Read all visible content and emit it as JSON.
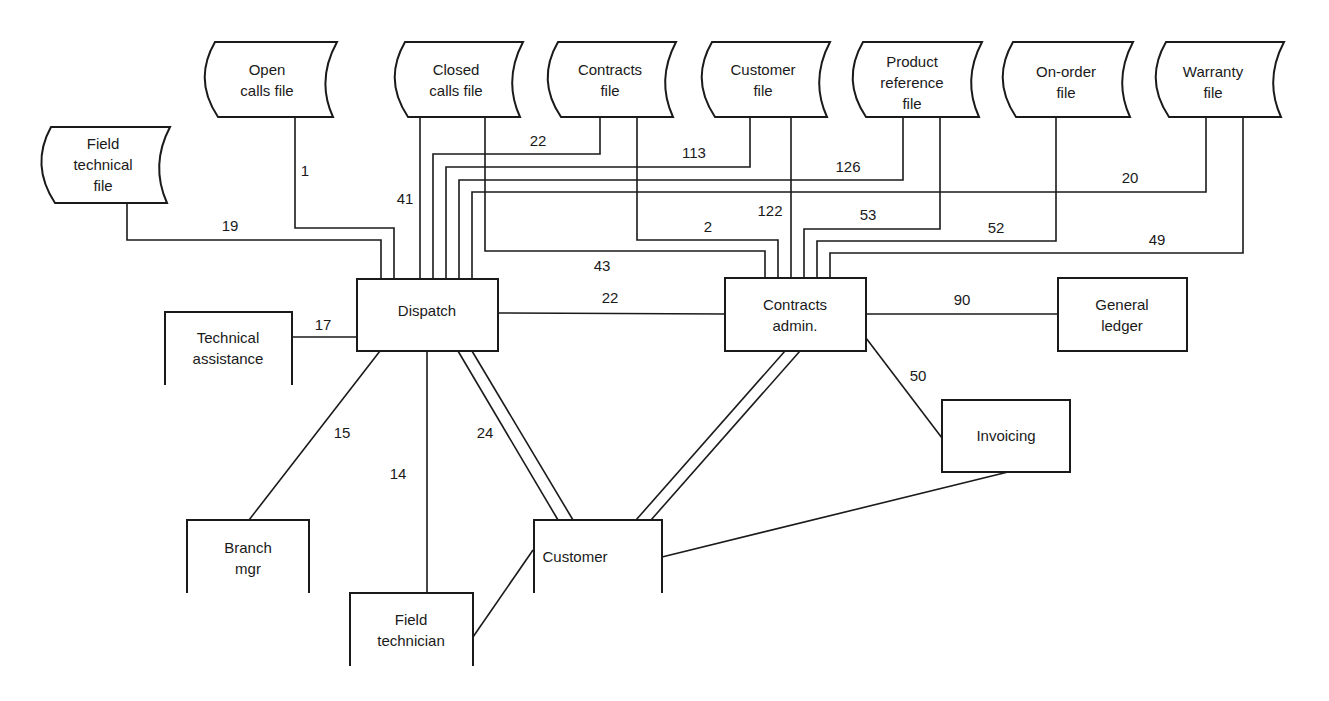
{
  "diagram": {
    "type": "data-flow-diagram",
    "files": [
      {
        "id": "field_technical_file",
        "label_lines": [
          "Field",
          "technical",
          "file"
        ]
      },
      {
        "id": "open_calls_file",
        "label_lines": [
          "Open",
          "calls file"
        ]
      },
      {
        "id": "closed_calls_file",
        "label_lines": [
          "Closed",
          "calls file"
        ]
      },
      {
        "id": "contracts_file",
        "label_lines": [
          "Contracts",
          "file"
        ]
      },
      {
        "id": "customer_file",
        "label_lines": [
          "Customer",
          "file"
        ]
      },
      {
        "id": "product_reference_file",
        "label_lines": [
          "Product",
          "reference",
          "file"
        ]
      },
      {
        "id": "on_order_file",
        "label_lines": [
          "On-order",
          "file"
        ]
      },
      {
        "id": "warranty_file",
        "label_lines": [
          "Warranty",
          "file"
        ]
      }
    ],
    "processes": [
      {
        "id": "dispatch",
        "label_lines": [
          "Dispatch"
        ]
      },
      {
        "id": "contracts_admin",
        "label_lines": [
          "Contracts",
          "admin."
        ]
      },
      {
        "id": "general_ledger",
        "label_lines": [
          "General",
          "ledger"
        ]
      },
      {
        "id": "invoicing",
        "label_lines": [
          "Invoicing"
        ]
      }
    ],
    "external_entities": [
      {
        "id": "technical_assistance",
        "label_lines": [
          "Technical",
          "assistance"
        ]
      },
      {
        "id": "branch_mgr",
        "label_lines": [
          "Branch",
          "mgr"
        ]
      },
      {
        "id": "field_technician",
        "label_lines": [
          "Field",
          "technician"
        ]
      },
      {
        "id": "customer",
        "label_lines": [
          "Customer"
        ]
      }
    ],
    "flows": [
      {
        "from": "field_technical_file",
        "to": "dispatch",
        "label": "19"
      },
      {
        "from": "open_calls_file",
        "to": "dispatch",
        "label": "1"
      },
      {
        "from": "closed_calls_file",
        "to": "dispatch",
        "label": "41"
      },
      {
        "from": "contracts_file",
        "to": "dispatch",
        "label": "22"
      },
      {
        "from": "customer_file",
        "to": "dispatch",
        "label": "113"
      },
      {
        "from": "product_reference_file",
        "to": "dispatch",
        "label": "126"
      },
      {
        "from": "warranty_file",
        "to": "dispatch",
        "label": "20"
      },
      {
        "from": "closed_calls_file",
        "to": "contracts_admin",
        "label": "43"
      },
      {
        "from": "contracts_file",
        "to": "contracts_admin",
        "label": "2"
      },
      {
        "from": "customer_file",
        "to": "contracts_admin",
        "label": "122"
      },
      {
        "from": "product_reference_file",
        "to": "contracts_admin",
        "label": "53"
      },
      {
        "from": "on_order_file",
        "to": "contracts_admin",
        "label": "52"
      },
      {
        "from": "warranty_file",
        "to": "contracts_admin",
        "label": "49"
      },
      {
        "from": "dispatch",
        "to": "contracts_admin",
        "label": "22"
      },
      {
        "from": "technical_assistance",
        "to": "dispatch",
        "label": "17"
      },
      {
        "from": "dispatch",
        "to": "branch_mgr",
        "label": "15"
      },
      {
        "from": "dispatch",
        "to": "field_technician",
        "label": "14"
      },
      {
        "from": "dispatch",
        "to": "customer",
        "label": "24"
      },
      {
        "from": "contracts_admin",
        "to": "general_ledger",
        "label": "90"
      },
      {
        "from": "contracts_admin",
        "to": "invoicing",
        "label": "50"
      },
      {
        "from": "contracts_admin",
        "to": "customer",
        "label": ""
      },
      {
        "from": "invoicing",
        "to": "customer",
        "label": ""
      },
      {
        "from": "field_technician",
        "to": "customer",
        "label": ""
      }
    ]
  },
  "labels": {
    "field_technical_file": [
      "Field",
      "technical",
      "file"
    ],
    "open_calls_file": [
      "Open",
      "calls file"
    ],
    "closed_calls_file": [
      "Closed",
      "calls file"
    ],
    "contracts_file": [
      "Contracts",
      "file"
    ],
    "customer_file": [
      "Customer",
      "file"
    ],
    "product_reference_file": [
      "Product",
      "reference",
      "file"
    ],
    "on_order_file": [
      "On-order",
      "file"
    ],
    "warranty_file": [
      "Warranty",
      "file"
    ],
    "dispatch": [
      "Dispatch"
    ],
    "contracts_admin": [
      "Contracts",
      "admin."
    ],
    "general_ledger": [
      "General",
      "ledger"
    ],
    "invoicing": [
      "Invoicing"
    ],
    "technical_assistance": [
      "Technical",
      "assistance"
    ],
    "branch_mgr": [
      "Branch",
      "mgr"
    ],
    "field_technician": [
      "Field",
      "technician"
    ],
    "customer": [
      "Customer"
    ]
  },
  "flow_labels": {
    "f19": "19",
    "f1": "1",
    "f41": "41",
    "f22a": "22",
    "f113": "113",
    "f126": "126",
    "f20": "20",
    "f43": "43",
    "f2": "2",
    "f122": "122",
    "f53": "53",
    "f52": "52",
    "f49": "49",
    "f22b": "22",
    "f17": "17",
    "f15": "15",
    "f14": "14",
    "f24": "24",
    "f90": "90",
    "f50": "50"
  }
}
